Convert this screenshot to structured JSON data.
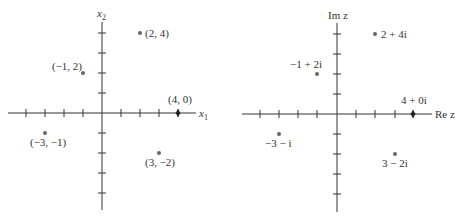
{
  "colors": {
    "axis": "#333333",
    "point": "#666666",
    "text": "#333333"
  },
  "left_plot": {
    "title": "Cartesian plane",
    "x_axis_label": "x",
    "x_axis_sub": "1",
    "y_axis_label": "x",
    "y_axis_sub": "2",
    "points": [
      {
        "label": "(2, 4)",
        "x": 2,
        "y": 4
      },
      {
        "label": "(−1, 2)",
        "x": -1,
        "y": 2
      },
      {
        "label": "(4, 0)",
        "x": 4,
        "y": 0
      },
      {
        "label": "(−3, −1)",
        "x": -3,
        "y": -1
      },
      {
        "label": "(3, −2)",
        "x": 3,
        "y": -2
      }
    ]
  },
  "right_plot": {
    "title": "Complex plane",
    "x_axis_label": "Re z",
    "y_axis_label": "Im z",
    "points": [
      {
        "label": "2 + 4i",
        "re": 2,
        "im": 4
      },
      {
        "label": "−1 + 2i",
        "re": -1,
        "im": 2
      },
      {
        "label": "4 + 0i",
        "re": 4,
        "im": 0
      },
      {
        "label": "−3 − i",
        "re": -3,
        "im": -1
      },
      {
        "label": "3 − 2i",
        "re": 3,
        "im": -2
      }
    ]
  },
  "axis_range": {
    "x": [
      -4,
      4
    ],
    "y": [
      -5,
      4
    ]
  }
}
